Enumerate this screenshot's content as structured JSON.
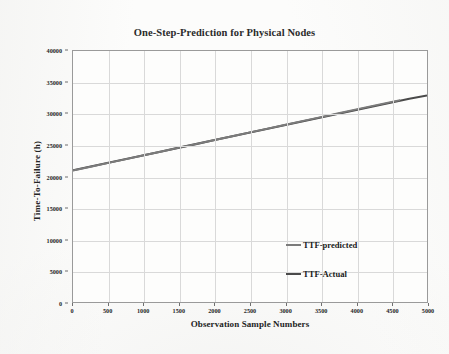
{
  "chart_data": {
    "type": "line",
    "title": "One-Step-Prediction for Physical Nodes",
    "xlabel": "Observation Sample Numbers",
    "ylabel": "Time-To-Failure (h)",
    "xlim": [
      0,
      5000
    ],
    "ylim": [
      0,
      40000
    ],
    "grid": true,
    "legend_position": "inside-right-lower",
    "xticks": [
      0,
      500,
      1000,
      1500,
      2000,
      2500,
      3000,
      3500,
      4000,
      4500,
      5000
    ],
    "yticks": [
      0,
      5000,
      10000,
      15000,
      20000,
      25000,
      30000,
      35000,
      40000
    ],
    "series": [
      {
        "name": "TTF-predicted",
        "color": "#6e6e6e",
        "x": [
          0,
          250,
          500,
          750,
          1000,
          1250,
          1500,
          1750,
          2000,
          2250,
          2500,
          2750,
          3000,
          3250,
          3500,
          3750,
          4000,
          4250,
          4500,
          4620
        ],
        "values": [
          20950,
          21560,
          22160,
          22780,
          23380,
          23990,
          24600,
          25210,
          25810,
          26420,
          27030,
          27640,
          28240,
          28860,
          29470,
          30080,
          30690,
          31290,
          31900,
          32180
        ]
      },
      {
        "name": "TTF-Actual",
        "color": "#4a4a4a",
        "x": [
          0,
          250,
          500,
          750,
          1000,
          1250,
          1500,
          1750,
          2000,
          2250,
          2500,
          2750,
          3000,
          3250,
          3500,
          3750,
          4000,
          4250,
          4500,
          4750,
          5000
        ],
        "values": [
          21000,
          21600,
          22200,
          22800,
          23400,
          24000,
          24600,
          25200,
          25800,
          26400,
          27000,
          27600,
          28200,
          28800,
          29400,
          30000,
          30600,
          31200,
          31800,
          32400,
          32900
        ]
      }
    ]
  },
  "legend": {
    "items": [
      {
        "label": "TTF-predicted"
      },
      {
        "label": "TTF-Actual"
      }
    ]
  }
}
